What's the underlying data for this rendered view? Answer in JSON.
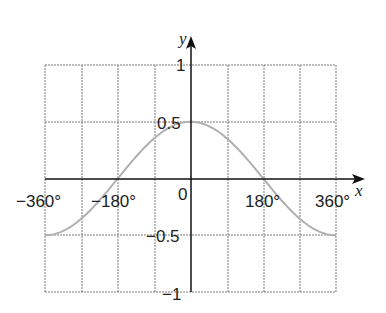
{
  "chart_data": {
    "type": "line",
    "title": "",
    "xlabel": "x",
    "ylabel": "y",
    "function": "y = 0.5 cos(x/2)",
    "xlim": [
      -360,
      360
    ],
    "ylim": [
      -1,
      1
    ],
    "grid": true,
    "grid_x_step": 90,
    "grid_y_step": 0.5,
    "x_tick_labels": [
      "−360°",
      "−180°",
      "0",
      "180°",
      "360°"
    ],
    "y_tick_labels": [
      "1",
      "0.5",
      "−0.5",
      "−1"
    ],
    "series": [
      {
        "name": "curve",
        "color": "#b0b0b0",
        "x": [
          -360,
          -270,
          -180,
          -90,
          0,
          90,
          180,
          270,
          360
        ],
        "y": [
          -0.5,
          -0.354,
          0,
          0.354,
          0.5,
          0.354,
          0,
          -0.354,
          -0.5
        ]
      }
    ]
  },
  "labels": {
    "x_axis": "x",
    "y_axis": "y",
    "origin": "0",
    "x_neg360": "−360°",
    "x_neg180": "−180°",
    "x_180": "180°",
    "x_360": "360°",
    "y_1": "1",
    "y_05": "0.5",
    "y_neg05": "−0.5",
    "y_neg1": "−1"
  },
  "colors": {
    "grid": "#7a7a7a",
    "axis": "#111111",
    "curve": "#b0b0b0"
  }
}
